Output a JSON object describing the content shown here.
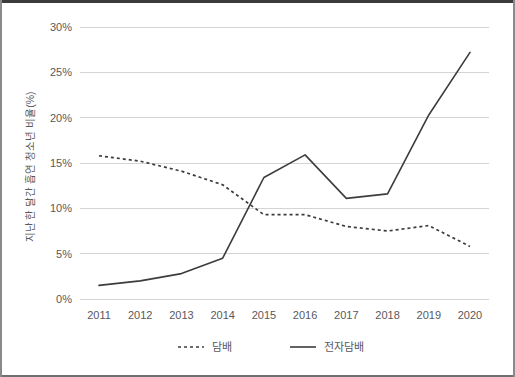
{
  "chart_data": {
    "type": "line",
    "title": "",
    "xlabel": "",
    "ylabel": "지난 한 달간 흡연 청소년 비율(%)",
    "categories": [
      "2011",
      "2012",
      "2013",
      "2014",
      "2015",
      "2016",
      "2017",
      "2018",
      "2019",
      "2020"
    ],
    "x": [
      2011,
      2012,
      2013,
      2014,
      2015,
      2016,
      2017,
      2018,
      2019,
      2020
    ],
    "ylim": [
      0,
      30
    ],
    "yticks": [
      0,
      5,
      10,
      15,
      20,
      25,
      30
    ],
    "ytick_labels": [
      "0%",
      "5%",
      "10%",
      "15%",
      "20%",
      "25%",
      "30%"
    ],
    "grid": true,
    "legend_position": "bottom",
    "series": [
      {
        "name": "담배",
        "style": "dotted",
        "color": "#3c3c3c",
        "values": [
          15.8,
          15.2,
          14.1,
          12.6,
          9.3,
          9.3,
          8.0,
          7.5,
          8.1,
          5.8
        ]
      },
      {
        "name": "전자담배",
        "style": "solid",
        "color": "#3c3c3c",
        "values": [
          1.5,
          2.0,
          2.8,
          4.5,
          13.4,
          15.9,
          11.1,
          11.6,
          20.3,
          27.2
        ]
      }
    ]
  },
  "axes": {
    "y_axis_title": "지난 한 달간 흡연 청소년 비율(%)",
    "tick_color": "#59595b",
    "gridline_color": "#d4d4d4"
  },
  "legend": {
    "items": [
      {
        "label": "담배",
        "style": "dotted"
      },
      {
        "label": "전자담배",
        "style": "solid"
      }
    ]
  }
}
